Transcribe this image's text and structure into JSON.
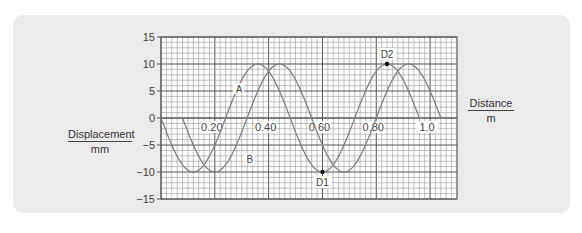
{
  "chart_data": {
    "type": "line",
    "title": "",
    "xlabel": "Distance",
    "xunit": "m",
    "ylabel": "Displacement",
    "yunit": "mm",
    "xlim": [
      0,
      1.1
    ],
    "ylim": [
      -15,
      15
    ],
    "x_ticks": [
      "0.20",
      "0.40",
      "0.60",
      "0.80",
      "1.0"
    ],
    "y_ticks": [
      "15",
      "10",
      "5",
      "0",
      "-5",
      "-10",
      "-15"
    ],
    "grid": true,
    "series": [
      {
        "name": "A",
        "amplitude": 10,
        "wavelength": 0.48,
        "x_start": 0.0,
        "x_end": 0.96,
        "x": [
          0,
          0.12,
          0.24,
          0.36,
          0.48,
          0.6,
          0.72,
          0.84,
          0.96
        ],
        "y": [
          0,
          -10,
          0,
          10,
          0,
          -10,
          0,
          10,
          0
        ]
      },
      {
        "name": "B",
        "amplitude": 10,
        "wavelength": 0.48,
        "x_start": 0.08,
        "x_end": 1.04,
        "x": [
          0.08,
          0.2,
          0.32,
          0.44,
          0.56,
          0.68,
          0.8,
          0.92,
          1.04
        ],
        "y": [
          0,
          -10,
          0,
          10,
          0,
          -10,
          0,
          10,
          0
        ]
      }
    ],
    "annotations": [
      {
        "label": "D1",
        "x": 0.6,
        "y": -10
      },
      {
        "label": "D2",
        "x": 0.84,
        "y": 10
      },
      {
        "label": "A",
        "x": 0.29,
        "y": 5
      },
      {
        "label": "B",
        "x": 0.33,
        "y": -8
      }
    ]
  },
  "labels": {
    "ylabel": "Displacement",
    "yunit": "mm",
    "xlabel": "Distance",
    "xunit": "m"
  },
  "colors": {
    "panel": "#ebebeb",
    "grid": "#555555",
    "curve": "#777777",
    "text": "#444444"
  }
}
